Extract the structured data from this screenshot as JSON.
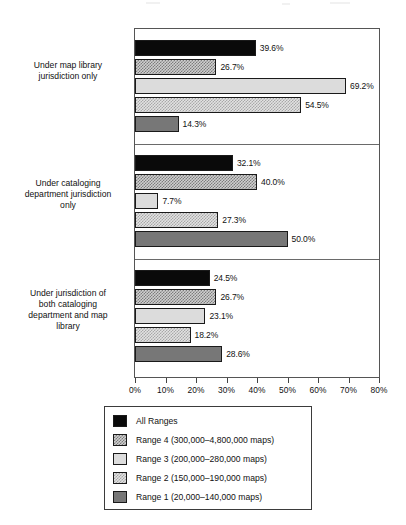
{
  "chart_data": {
    "type": "bar",
    "orientation": "horizontal",
    "title": "",
    "xlabel": "",
    "ylabel": "",
    "xlim": [
      0,
      80
    ],
    "xtick_labels": [
      "0%",
      "10%",
      "20%",
      "30%",
      "40%",
      "50%",
      "60%",
      "70%",
      "80%"
    ],
    "xtick_values": [
      0,
      10,
      20,
      30,
      40,
      50,
      60,
      70,
      80
    ],
    "grid": false,
    "legend_position": "below",
    "categories": [
      "Under map library jurisdiction only",
      "Under cataloging department jurisdiction only",
      "Under jurisdiction of both cataloging department and map library"
    ],
    "series": [
      {
        "name": "All Ranges",
        "values": [
          39.6,
          32.1,
          24.5
        ],
        "labels": [
          "39.6%",
          "32.1%",
          "24.5%"
        ],
        "fill": "solid-black",
        "color": "#0a0a0a"
      },
      {
        "name": "Range 4 (300,000–4,800,000 maps)",
        "values": [
          26.7,
          40.0,
          26.7
        ],
        "labels": [
          "26.7%",
          "40.0%",
          "26.7%"
        ],
        "fill": "checker-dark",
        "color": "#7d7d7d"
      },
      {
        "name": "Range 3 (200,000–280,000 maps)",
        "values": [
          69.2,
          7.7,
          23.1
        ],
        "labels": [
          "69.2%",
          "7.7%",
          "23.1%"
        ],
        "fill": "solid-light-gray",
        "color": "#dcdcdc"
      },
      {
        "name": "Range 2 (150,000–190,000 maps)",
        "values": [
          54.5,
          27.3,
          18.2
        ],
        "labels": [
          "54.5%",
          "27.3%",
          "18.2%"
        ],
        "fill": "checker-light",
        "color": "#a8a8a8"
      },
      {
        "name": "Range 1 (20,000–140,000 maps)",
        "values": [
          14.3,
          50.0,
          28.6
        ],
        "labels": [
          "14.3%",
          "50.0%",
          "28.6%"
        ],
        "fill": "solid-mid-gray",
        "color": "#777777"
      }
    ]
  },
  "category_labels": {
    "group0": [
      "Under map library",
      "jurisdiction only"
    ],
    "group1": [
      "Under cataloging",
      "department jurisdiction",
      "only"
    ],
    "group2": [
      "Under jurisdiction of",
      "both cataloging",
      "department and map",
      "library"
    ]
  },
  "legend": {
    "items": [
      {
        "label": "All Ranges",
        "swatch": "solid-black"
      },
      {
        "label": "Range 4 (300,000–4,800,000 maps)",
        "swatch": "checker-dark"
      },
      {
        "label": "Range 3 (200,000–280,000 maps)",
        "swatch": "solid-light-gray"
      },
      {
        "label": "Range 2 (150,000–190,000 maps)",
        "swatch": "checker-light"
      },
      {
        "label": "Range 1 (20,000–140,000 maps)",
        "swatch": "solid-mid-gray"
      }
    ]
  }
}
